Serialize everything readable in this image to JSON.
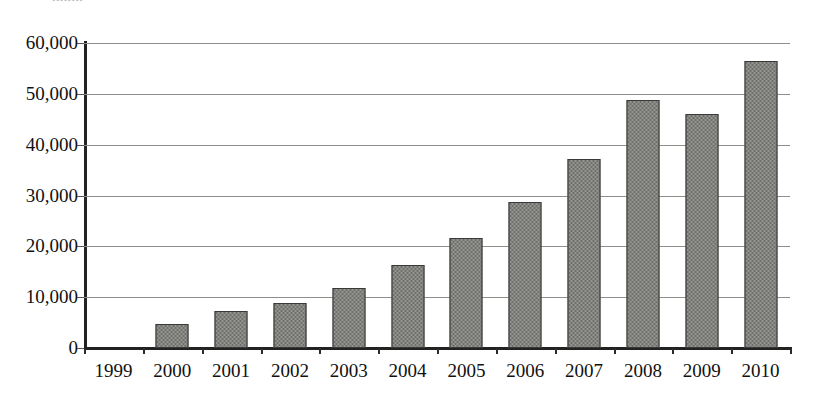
{
  "figure": {
    "clipped_caption": "........",
    "background": "#ffffff",
    "bar_color": "#6e6e6a",
    "bar_border_color": "#3a3a38",
    "gridline_color": "#8e8e8a",
    "axis_color": "#222222"
  },
  "chart_data": {
    "type": "bar",
    "title": "",
    "xlabel": "",
    "ylabel": "",
    "categories": [
      "1999",
      "2000",
      "2001",
      "2002",
      "2003",
      "2004",
      "2005",
      "2006",
      "2007",
      "2008",
      "2009",
      "2010"
    ],
    "values": [
      0,
      4800,
      7300,
      8800,
      11800,
      16300,
      21700,
      28800,
      37200,
      48700,
      46000,
      56400
    ],
    "ylim": [
      0,
      60000
    ],
    "ytick_values": [
      0,
      10000,
      20000,
      30000,
      40000,
      50000,
      60000
    ],
    "ytick_labels": [
      "0",
      "10,000",
      "20,000",
      "30,000",
      "40,000",
      "50,000",
      "60,000"
    ],
    "grid": true,
    "grid_axis": "y",
    "legend": null,
    "series": [
      {
        "name": "series-1",
        "values": [
          0,
          4800,
          7300,
          8800,
          11800,
          16300,
          21700,
          28800,
          37200,
          48700,
          46000,
          56400
        ]
      }
    ]
  }
}
